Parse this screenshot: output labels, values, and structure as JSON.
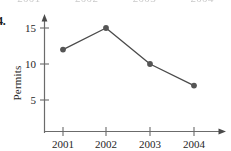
{
  "figure": {
    "problem_number": "4.",
    "clipped_top_text": [
      "2001",
      "2002",
      "2003",
      "2004"
    ]
  },
  "chart_data": {
    "type": "line",
    "title": "",
    "xlabel": "",
    "ylabel": "Permits",
    "categories": [
      "2001",
      "2002",
      "2003",
      "2004"
    ],
    "values": [
      12,
      15,
      10,
      7
    ],
    "series": [
      {
        "name": "Permits",
        "values": [
          12,
          15,
          10,
          7
        ]
      }
    ],
    "ytick_labels": [
      "5",
      "10",
      "15"
    ],
    "ytick_values": [
      5,
      10,
      15
    ],
    "xtick_labels": [
      "2001",
      "2002",
      "2003",
      "2004"
    ],
    "ylim": [
      0,
      16.5
    ],
    "grid": false,
    "legend": "none",
    "marker": "circle",
    "line_color": "#4a4a4a",
    "marker_color": "#555555",
    "axis_color": "#6b6b6b"
  }
}
